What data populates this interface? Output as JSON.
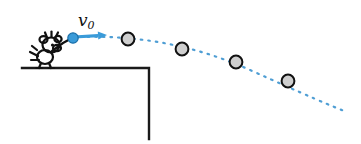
{
  "figure": {
    "name": "projectile-motion-from-ledge",
    "caption_text": "",
    "background_color": "#ffffff"
  },
  "labels": {
    "initial_velocity": {
      "symbol": "v",
      "subscript": "0",
      "full_text": "v0",
      "x": 78,
      "y": 12,
      "color": "#111111"
    }
  },
  "colors": {
    "ink_black": "#1a1a1a",
    "ball_fill": "#cfcfcf",
    "ball_stroke": "#111111",
    "trajectory_blue": "#4f9ed4",
    "arrow_blue": "#3a9bd9",
    "launch_ball_blue": "#3a9bd9",
    "launch_ball_stroke": "#1b6fa8"
  },
  "ledge": {
    "name": "ledge-platform",
    "top_y": 68,
    "left_x": 22,
    "corner_x": 149,
    "bottom_y": 139,
    "stroke_width": 2.4
  },
  "thrower": {
    "name": "stick-figure-thrower",
    "description": "cartoon figure throwing a ball",
    "head_cx": 51,
    "head_cy": 44,
    "body_cx": 46,
    "body_cy": 56,
    "stroke_width": 2.2
  },
  "launch": {
    "name": "launch-ball",
    "cx": 73,
    "cy": 38,
    "r": 5.2
  },
  "velocity_arrow": {
    "name": "initial-velocity-arrow",
    "x1": 74,
    "y1": 37,
    "x2": 107,
    "y2": 35,
    "head_length": 9,
    "head_width": 8,
    "stroke_width": 3.2
  },
  "chart_data": {
    "type": "scatter",
    "xlabel": "",
    "ylabel": "",
    "series": [
      {
        "name": "ball-positions",
        "points": [
          {
            "label": "p0",
            "x": 73,
            "y": 38,
            "r": 5.2,
            "style": "launch"
          },
          {
            "label": "p1",
            "x": 128,
            "y": 39,
            "r": 6.4,
            "style": "gray"
          },
          {
            "label": "p2",
            "x": 182,
            "y": 49,
            "r": 6.4,
            "style": "gray"
          },
          {
            "label": "p3",
            "x": 236,
            "y": 62,
            "r": 6.4,
            "style": "gray"
          },
          {
            "label": "p4",
            "x": 288,
            "y": 81,
            "r": 6.4,
            "style": "gray"
          }
        ]
      }
    ],
    "trajectory": {
      "name": "parabolic-dotted-path",
      "path": "M 80 37 Q 170 34 250 70 T 347 112",
      "dash": "1.6 6",
      "stroke_width": 2.2,
      "color": "#4f9ed4"
    },
    "grid": false,
    "legend": false
  }
}
